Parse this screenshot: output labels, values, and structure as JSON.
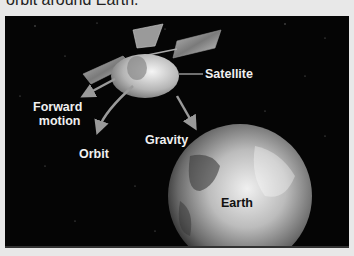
{
  "caption": "orbit around Earth.",
  "diagram": {
    "labels": {
      "satellite": "Satellite",
      "forward_motion_line1": "Forward",
      "forward_motion_line2": "motion",
      "orbit": "Orbit",
      "gravity": "Gravity",
      "earth": "Earth"
    },
    "colors": {
      "background": "#050505",
      "page": "#e8e8e8",
      "label": "#f0f0f0",
      "arrow": "#9a9a9a"
    }
  }
}
